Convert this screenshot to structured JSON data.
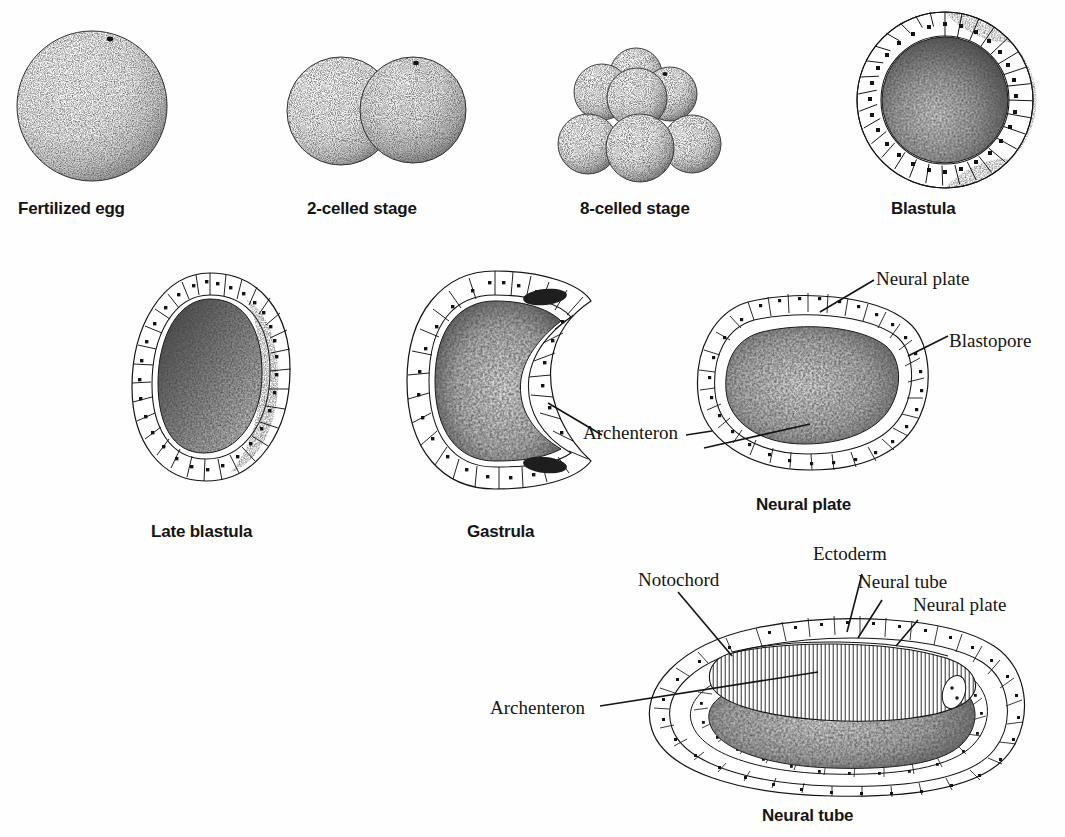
{
  "figure": {
    "background_color": "#fefefe",
    "ink_color": "#141414"
  },
  "stages": [
    {
      "id": "fertilized-egg",
      "label": "Fertilized egg",
      "row": 1,
      "caption_x": 18,
      "caption_y": 199
    },
    {
      "id": "two-celled-stage",
      "label": "2-celled stage",
      "row": 1,
      "caption_x": 307,
      "caption_y": 199
    },
    {
      "id": "eight-celled-stage",
      "label": "8-celled stage",
      "row": 1,
      "caption_x": 580,
      "caption_y": 199
    },
    {
      "id": "blastula",
      "label": "Blastula",
      "row": 1,
      "caption_x": 891,
      "caption_y": 199
    },
    {
      "id": "late-blastula",
      "label": "Late blastula",
      "row": 2,
      "caption_x": 151,
      "caption_y": 522
    },
    {
      "id": "gastrula",
      "label": "Gastrula",
      "row": 2,
      "caption_x": 467,
      "caption_y": 522
    },
    {
      "id": "neural-plate",
      "label": "Neural plate",
      "row": 2,
      "caption_x": 756,
      "caption_y": 495
    },
    {
      "id": "neural-tube",
      "label": "Neural tube",
      "row": 3,
      "caption_x": 762,
      "caption_y": 806
    }
  ],
  "callouts": {
    "gastrula": [
      {
        "id": "archenteron",
        "label": "Archenteron",
        "x": 583,
        "y": 422
      }
    ],
    "neural_plate": [
      {
        "id": "neural-plate",
        "label": "Neural plate",
        "x": 876,
        "y": 268
      },
      {
        "id": "blastopore",
        "label": "Blastopore",
        "x": 949,
        "y": 330
      }
    ],
    "neural_tube": [
      {
        "id": "ectoderm",
        "label": "Ectoderm",
        "x": 813,
        "y": 543
      },
      {
        "id": "notochord",
        "label": "Notochord",
        "x": 638,
        "y": 569
      },
      {
        "id": "neural-tube",
        "label": "Neural tube",
        "x": 858,
        "y": 571
      },
      {
        "id": "neural-plate",
        "label": "Neural plate",
        "x": 913,
        "y": 594
      },
      {
        "id": "archenteron",
        "label": "Archenteron",
        "x": 490,
        "y": 697
      }
    ]
  }
}
